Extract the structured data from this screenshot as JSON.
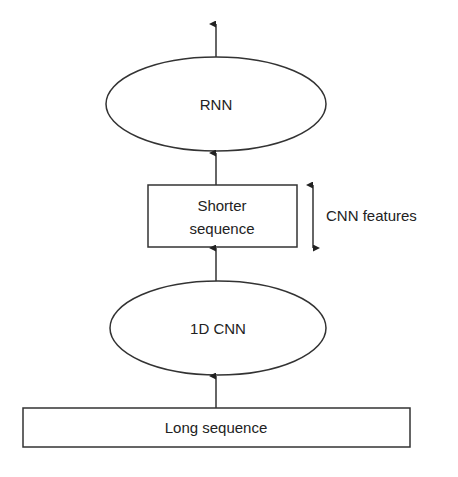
{
  "diagram": {
    "colors": {
      "stroke": "#333333",
      "text": "#222222",
      "background": "#ffffff"
    },
    "nodes": {
      "rnn": {
        "label": "RNN",
        "shape": "ellipse"
      },
      "shorter_sequence": {
        "label_line1": "Shorter",
        "label_line2": "sequence",
        "shape": "rectangle"
      },
      "cnn": {
        "label": "1D CNN",
        "shape": "ellipse"
      },
      "long_sequence": {
        "label": "Long sequence",
        "shape": "rectangle"
      }
    },
    "annotation": {
      "label": "CNN features",
      "icon": "double-arrow-vertical"
    },
    "edges": [
      {
        "from": "long_sequence",
        "to": "cnn"
      },
      {
        "from": "cnn",
        "to": "shorter_sequence"
      },
      {
        "from": "shorter_sequence",
        "to": "rnn"
      },
      {
        "from": "rnn",
        "to": "output"
      }
    ]
  }
}
